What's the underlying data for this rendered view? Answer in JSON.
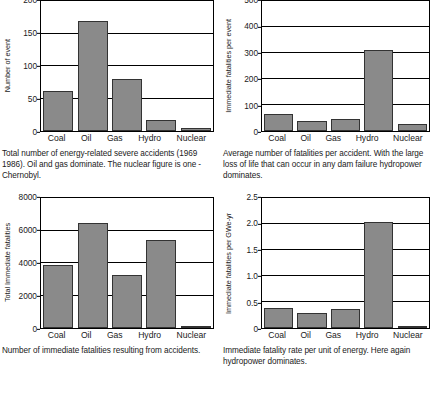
{
  "figure": {
    "categories": [
      "Coal",
      "Oil",
      "Gas",
      "Hydro",
      "Nuclear"
    ],
    "bar_color": "#8a8a8a",
    "bar_edge_color": "#333333",
    "axis_color": "#000000",
    "background": "#ffffff"
  },
  "charts": [
    {
      "id": "severe-accidents",
      "caption": "Total number of energy-related severe accidents (1969 1986). Oil and gas dominate. The nuclear figure is one - Chernobyl.",
      "ylabel": "Number of event",
      "yticks": [
        "200",
        "150",
        "100",
        "50",
        "0"
      ],
      "xlabels": [
        "Coal",
        "Oil",
        "Gas",
        "Hydro",
        "Nuclear"
      ]
    },
    {
      "id": "fatalities-per-event",
      "caption": "Average number of fatalities per accident. With the large loss of life that can occur in any dam failure hydropower dominates.",
      "ylabel": "Immediate fatalities per event",
      "yticks": [
        "500",
        "400",
        "300",
        "200",
        "100",
        "0"
      ],
      "xlabels": [
        "Coal",
        "Oil",
        "Gas",
        "Hydro",
        "Nuclear"
      ]
    },
    {
      "id": "total-immediate-fatalities",
      "caption": "Number of immediate fatalities resulting from accidents.",
      "ylabel": "Total Immediate fatalities",
      "yticks": [
        "8000",
        "6000",
        "4000",
        "2000",
        "0"
      ],
      "xlabels": [
        "Coal",
        "Oil",
        "Gas",
        "Hydro",
        "Nuclear"
      ]
    },
    {
      "id": "fatality-rate-per-energy",
      "caption": "Immediate fatality rate per unit of energy. Here again hydropower dominates.",
      "ylabel": "Immediate fatalities per GWe-yr",
      "yticks": [
        "2.5",
        "2.0",
        "1.5",
        "1.0",
        "0.5",
        "0"
      ],
      "xlabels": [
        "Coal",
        "Oil",
        "Gas",
        "Hydro",
        "Nuclear"
      ]
    }
  ],
  "chart_data": [
    {
      "type": "bar",
      "id": "severe-accidents",
      "title": "Total number of energy-related severe accidents (1969 1986)",
      "categories": [
        "Coal",
        "Oil",
        "Gas",
        "Hydro",
        "Nuclear"
      ],
      "values": [
        61,
        169,
        80,
        17,
        4
      ],
      "xlabel": "",
      "ylabel": "Number of event",
      "ylim": [
        0,
        200
      ],
      "ytick_values": [
        0,
        50,
        100,
        150,
        200
      ],
      "grid": true,
      "legend": "none"
    },
    {
      "type": "bar",
      "id": "fatalities-per-event",
      "title": "Average number of fatalities per accident",
      "categories": [
        "Coal",
        "Oil",
        "Gas",
        "Hydro",
        "Nuclear"
      ],
      "values": [
        65,
        38,
        48,
        310,
        28
      ],
      "xlabel": "",
      "ylabel": "Immediate fatalities per event",
      "ylim": [
        0,
        500
      ],
      "ytick_values": [
        0,
        100,
        200,
        300,
        400,
        500
      ],
      "grid": true,
      "legend": "none"
    },
    {
      "type": "bar",
      "id": "total-immediate-fatalities",
      "title": "Number of immediate fatalities resulting from accidents",
      "categories": [
        "Coal",
        "Oil",
        "Gas",
        "Hydro",
        "Nuclear"
      ],
      "values": [
        3900,
        6480,
        3260,
        5390,
        120
      ],
      "xlabel": "",
      "ylabel": "Total Immediate fatalities",
      "ylim": [
        0,
        8000
      ],
      "ytick_values": [
        0,
        2000,
        4000,
        6000,
        8000
      ],
      "grid": true,
      "legend": "none"
    },
    {
      "type": "bar",
      "id": "fatality-rate-per-energy",
      "title": "Immediate fatality rate per unit of energy",
      "categories": [
        "Coal",
        "Oil",
        "Gas",
        "Hydro",
        "Nuclear"
      ],
      "values": [
        0.39,
        0.28,
        0.37,
        2.03,
        0.02
      ],
      "xlabel": "",
      "ylabel": "Immediate fatalities per GWe-yr",
      "ylim": [
        0,
        2.5
      ],
      "ytick_values": [
        0,
        0.5,
        1.0,
        1.5,
        2.0,
        2.5
      ],
      "grid": true,
      "legend": "none"
    }
  ]
}
